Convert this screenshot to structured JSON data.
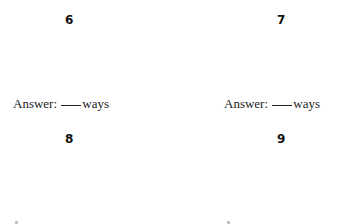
{
  "problems": [
    {
      "number": "6",
      "answer_label": "Answer:",
      "answer_unit": "ways"
    },
    {
      "number": "7",
      "answer_label": "Answer:",
      "answer_unit": "ways"
    },
    {
      "number": "8",
      "answer_label": "Answer:",
      "answer_unit": "ways"
    },
    {
      "number": "9",
      "answer_label": "Answer:",
      "answer_unit": "ways"
    }
  ]
}
